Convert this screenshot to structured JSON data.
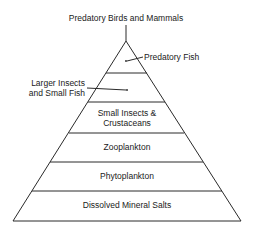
{
  "diagram": {
    "type": "food-pyramid",
    "top_label": "Predatory Birds and Mammals",
    "levels": [
      {
        "name": "Predatory Fish",
        "placement": "callout-right"
      },
      {
        "name": "Larger Insects and Small Fish",
        "lines": [
          "Larger Insects",
          "and Small Fish"
        ],
        "placement": "callout-left"
      },
      {
        "name": "Small Insects & Crustaceans",
        "lines": [
          "Small Insects &",
          "Crustaceans"
        ],
        "placement": "inside"
      },
      {
        "name": "Zooplankton",
        "placement": "inside"
      },
      {
        "name": "Phytoplankton",
        "placement": "inside"
      },
      {
        "name": "Dissolved Mineral Salts",
        "placement": "inside"
      }
    ]
  }
}
